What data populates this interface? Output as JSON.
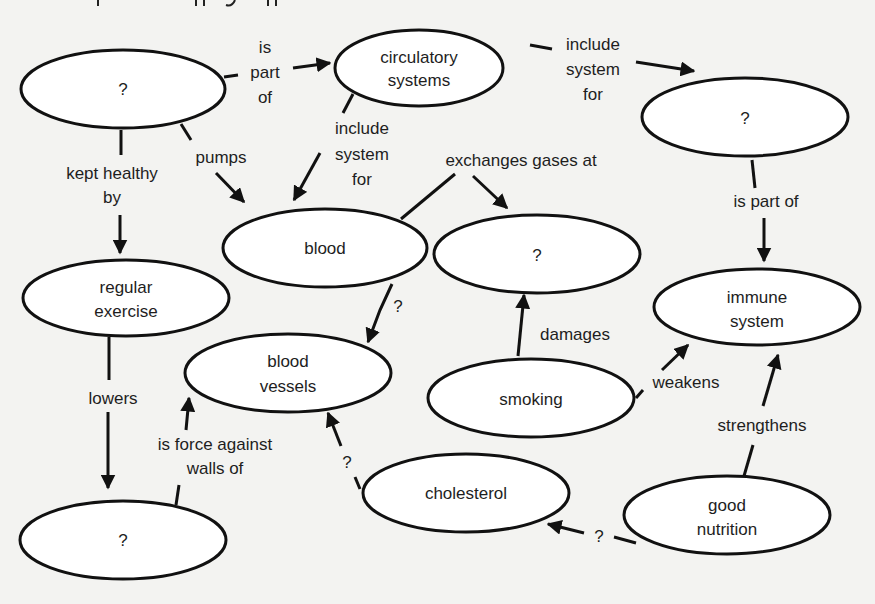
{
  "diagram": {
    "type": "concept-map",
    "nodes": [
      {
        "id": "heart",
        "label": [
          "?"
        ]
      },
      {
        "id": "circulatory",
        "label": [
          "circulatory",
          "systems"
        ]
      },
      {
        "id": "lymphatic",
        "label": [
          "?"
        ]
      },
      {
        "id": "blood",
        "label": [
          "blood"
        ]
      },
      {
        "id": "lungs",
        "label": [
          "?"
        ]
      },
      {
        "id": "immune",
        "label": [
          "immune",
          "system"
        ]
      },
      {
        "id": "exercise",
        "label": [
          "regular",
          "exercise"
        ]
      },
      {
        "id": "vessels",
        "label": [
          "blood",
          "vessels"
        ]
      },
      {
        "id": "smoking",
        "label": [
          "smoking"
        ]
      },
      {
        "id": "cholesterol",
        "label": [
          "cholesterol"
        ]
      },
      {
        "id": "pressure",
        "label": [
          "?"
        ]
      },
      {
        "id": "nutrition",
        "label": [
          "good",
          "nutrition"
        ]
      }
    ],
    "links": [
      {
        "from": "heart",
        "to": "circulatory",
        "label": [
          "is",
          "part",
          "of"
        ]
      },
      {
        "from": "circulatory",
        "to": "lymphatic",
        "label": [
          "include",
          "system",
          "for"
        ]
      },
      {
        "from": "circulatory",
        "to": "blood",
        "label": [
          "include",
          "system",
          "for"
        ]
      },
      {
        "from": "heart",
        "to": "blood",
        "label": [
          "pumps"
        ]
      },
      {
        "from": "heart",
        "to": "exercise",
        "label": [
          "kept healthy",
          "by"
        ]
      },
      {
        "from": "blood",
        "to": "lungs",
        "label": [
          "exchanges gases at"
        ]
      },
      {
        "from": "lymphatic",
        "to": "immune",
        "label": [
          "is part of"
        ]
      },
      {
        "from": "blood",
        "to": "vessels",
        "label": [
          "?"
        ]
      },
      {
        "from": "exercise",
        "to": "pressure",
        "label": [
          "lowers"
        ]
      },
      {
        "from": "pressure",
        "to": "vessels",
        "label": [
          "is force against",
          "walls of"
        ]
      },
      {
        "from": "smoking",
        "to": "lungs",
        "label": [
          "damages"
        ]
      },
      {
        "from": "smoking",
        "to": "immune",
        "label": [
          "weakens"
        ]
      },
      {
        "from": "nutrition",
        "to": "immune",
        "label": [
          "strengthens"
        ]
      },
      {
        "from": "cholesterol",
        "to": "vessels",
        "label": [
          "?"
        ]
      },
      {
        "from": "nutrition",
        "to": "cholesterol",
        "label": [
          "?"
        ]
      }
    ]
  },
  "text": {
    "n_heart": "?",
    "n_circ_1": "circulatory",
    "n_circ_2": "systems",
    "n_lymph": "?",
    "n_blood": "blood",
    "n_lungs": "?",
    "n_immune_1": "immune",
    "n_immune_2": "system",
    "n_ex_1": "regular",
    "n_ex_2": "exercise",
    "n_vessels_1": "blood",
    "n_vessels_2": "vessels",
    "n_smoking": "smoking",
    "n_chol": "cholesterol",
    "n_pressure": "?",
    "n_nut_1": "good",
    "n_nut_2": "nutrition",
    "l_ispartof_1": "is",
    "l_ispartof_2": "part",
    "l_ispartof_3": "of",
    "l_inc1_1": "include",
    "l_inc1_2": "system",
    "l_inc1_3": "for",
    "l_inc2_1": "include",
    "l_inc2_2": "system",
    "l_inc2_3": "for",
    "l_pumps": "pumps",
    "l_kept_1": "kept healthy",
    "l_kept_2": "by",
    "l_exchanges": "exchanges gases at",
    "l_ispartof2": "is part of",
    "l_bv_q": "?",
    "l_lowers": "lowers",
    "l_force_1": "is force against",
    "l_force_2": "walls of",
    "l_damages": "damages",
    "l_weakens": "weakens",
    "l_strengthens": "strengthens",
    "l_chol_q": "?",
    "l_nut_q": "?"
  },
  "colors": {
    "background": "#f3f3f1",
    "node_fill": "#ffffff",
    "stroke": "#111111",
    "text": "#1e1e1e"
  }
}
